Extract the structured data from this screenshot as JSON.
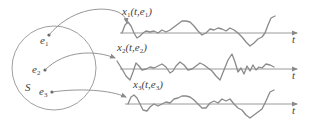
{
  "diagram": {
    "sample_space": {
      "label": "S"
    },
    "outcomes": [
      {
        "label": "e",
        "sub": "1"
      },
      {
        "label": "e",
        "sub": "2"
      },
      {
        "label": "e",
        "sub": "3"
      }
    ],
    "sample_functions": [
      {
        "name": "x",
        "sub": "1",
        "args_open": "(t,e",
        "args_sub": "1",
        "args_close": ")",
        "axis_label": "t"
      },
      {
        "name": "x",
        "sub": "2",
        "args_open": "(t,e",
        "args_sub": "2",
        "args_close": ")",
        "axis_label": "t"
      },
      {
        "name": "x",
        "sub": "3",
        "args_open": "(t,e",
        "args_sub": "3",
        "args_close": ")",
        "axis_label": "t"
      }
    ],
    "colors": {
      "stroke": "#8a8a8a",
      "text": "#444444",
      "background": "#ffffff"
    }
  }
}
